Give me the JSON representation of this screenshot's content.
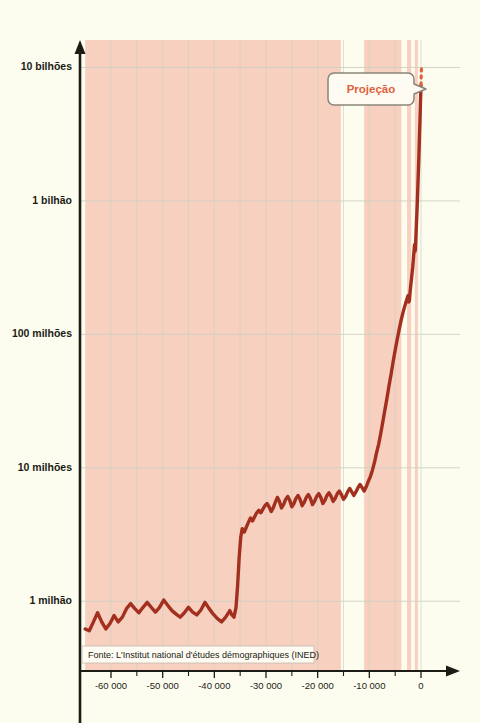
{
  "figure": {
    "background_color": "#fdfdef",
    "axis_color": "#1c1c16",
    "grid_color": "#cfcfc4",
    "curve_color": "#a32f1e",
    "band_color": "#f7d0c0",
    "annotation_color": "#d1553a",
    "projection_color": "#e2603c"
  },
  "source": {
    "label": "Fonte: L'Institut national d'études démographiques (INED)"
  },
  "callout": {
    "label": "Projeção"
  },
  "annotations": [
    {
      "name": "inovacoes",
      "lines": [
        "Inovações",
        "técnicas e",
        "sociais"
      ],
      "x": 224,
      "y": 607
    },
    {
      "name": "revolucao-neolitica",
      "lines": [
        "\"Revolução\"",
        "neolítica"
      ],
      "x": 380,
      "y": 487
    },
    {
      "name": "revolucao-industrial",
      "lines": [
        "Revolução",
        "industrial"
      ],
      "x": 424,
      "y": 396
    }
  ],
  "chart_data": {
    "type": "line",
    "title": "",
    "xlabel": "",
    "ylabel": "",
    "y_scale": "log",
    "ylim": [
      300000,
      14000000000
    ],
    "xlim": [
      -66000,
      6000
    ],
    "grid": true,
    "legend": "none",
    "y_ticks": [
      {
        "value": 1000000,
        "label": "1 milhão"
      },
      {
        "value": 10000000,
        "label": "10 milhões"
      },
      {
        "value": 100000000,
        "label": "100 milhões"
      },
      {
        "value": 1000000000,
        "label": "1 bilhão"
      },
      {
        "value": 10000000000,
        "label": "10 bilhões"
      }
    ],
    "x_ticks": [
      {
        "value": -60000,
        "label": "-60 000"
      },
      {
        "value": -50000,
        "label": "-50 000"
      },
      {
        "value": -40000,
        "label": "-40 000"
      },
      {
        "value": -30000,
        "label": "-30 000"
      },
      {
        "value": -20000,
        "label": "-20 000"
      },
      {
        "value": -10000,
        "label": "-10 000"
      },
      {
        "value": 0,
        "label": "0"
      }
    ],
    "shaded_bands": [
      {
        "name": "inovacoes-tecnicas-band",
        "x0": -65000,
        "x1": -15500
      },
      {
        "name": "neolitico-band",
        "x0": -11000,
        "x1": -3800
      },
      {
        "name": "revolucao-industrial-band",
        "x0": -2700,
        "x1": -1900
      },
      {
        "name": "era-moderna-band",
        "x0": -1200,
        "x1": -600
      }
    ],
    "series": [
      {
        "name": "População mundial",
        "points": [
          [
            -65000,
            620000
          ],
          [
            -64200,
            600000
          ],
          [
            -63400,
            700000
          ],
          [
            -62600,
            820000
          ],
          [
            -61800,
            700000
          ],
          [
            -61000,
            620000
          ],
          [
            -60200,
            680000
          ],
          [
            -59400,
            780000
          ],
          [
            -58600,
            700000
          ],
          [
            -57800,
            760000
          ],
          [
            -57000,
            880000
          ],
          [
            -56200,
            960000
          ],
          [
            -55400,
            880000
          ],
          [
            -54600,
            820000
          ],
          [
            -53800,
            900000
          ],
          [
            -53000,
            980000
          ],
          [
            -52200,
            900000
          ],
          [
            -51400,
            830000
          ],
          [
            -50600,
            900000
          ],
          [
            -49800,
            1020000
          ],
          [
            -49000,
            930000
          ],
          [
            -48200,
            850000
          ],
          [
            -47400,
            800000
          ],
          [
            -46600,
            760000
          ],
          [
            -45800,
            820000
          ],
          [
            -45000,
            900000
          ],
          [
            -44200,
            830000
          ],
          [
            -43400,
            790000
          ],
          [
            -42600,
            860000
          ],
          [
            -41800,
            980000
          ],
          [
            -41000,
            880000
          ],
          [
            -40200,
            800000
          ],
          [
            -39400,
            740000
          ],
          [
            -38600,
            700000
          ],
          [
            -37800,
            760000
          ],
          [
            -37000,
            850000
          ],
          [
            -36600,
            790000
          ],
          [
            -36200,
            760000
          ],
          [
            -35800,
            900000
          ],
          [
            -35500,
            1300000
          ],
          [
            -35200,
            2100000
          ],
          [
            -34900,
            3000000
          ],
          [
            -34600,
            3500000
          ],
          [
            -34200,
            3300000
          ],
          [
            -33800,
            3600000
          ],
          [
            -33400,
            3900000
          ],
          [
            -33000,
            4200000
          ],
          [
            -32600,
            4000000
          ],
          [
            -32200,
            4300000
          ],
          [
            -31800,
            4600000
          ],
          [
            -31400,
            4800000
          ],
          [
            -31000,
            4600000
          ],
          [
            -30600,
            4900000
          ],
          [
            -30200,
            5200000
          ],
          [
            -29800,
            5400000
          ],
          [
            -29400,
            5100000
          ],
          [
            -29000,
            4700000
          ],
          [
            -28600,
            5000000
          ],
          [
            -28200,
            5500000
          ],
          [
            -27800,
            6000000
          ],
          [
            -27400,
            5600000
          ],
          [
            -27000,
            5000000
          ],
          [
            -26600,
            5300000
          ],
          [
            -26200,
            5800000
          ],
          [
            -25800,
            6100000
          ],
          [
            -25400,
            5700000
          ],
          [
            -25000,
            5100000
          ],
          [
            -24600,
            5400000
          ],
          [
            -24200,
            5900000
          ],
          [
            -23800,
            6200000
          ],
          [
            -23400,
            5800000
          ],
          [
            -23000,
            5200000
          ],
          [
            -22600,
            5500000
          ],
          [
            -22200,
            6000000
          ],
          [
            -21800,
            6300000
          ],
          [
            -21400,
            5900000
          ],
          [
            -21000,
            5300000
          ],
          [
            -20600,
            5600000
          ],
          [
            -20200,
            6100000
          ],
          [
            -19800,
            6400000
          ],
          [
            -19400,
            6000000
          ],
          [
            -19000,
            5400000
          ],
          [
            -18600,
            5700000
          ],
          [
            -18200,
            6200000
          ],
          [
            -17800,
            6500000
          ],
          [
            -17400,
            6100000
          ],
          [
            -17000,
            5600000
          ],
          [
            -16600,
            5900000
          ],
          [
            -16200,
            6400000
          ],
          [
            -15800,
            6700000
          ],
          [
            -15400,
            6300000
          ],
          [
            -15000,
            5800000
          ],
          [
            -14600,
            6100000
          ],
          [
            -14200,
            6600000
          ],
          [
            -13800,
            7000000
          ],
          [
            -13400,
            6600000
          ],
          [
            -13000,
            6200000
          ],
          [
            -12600,
            6600000
          ],
          [
            -12200,
            7100000
          ],
          [
            -11800,
            7500000
          ],
          [
            -11400,
            7100000
          ],
          [
            -11000,
            6700000
          ],
          [
            -10600,
            7200000
          ],
          [
            -10200,
            7900000
          ],
          [
            -9800,
            8600000
          ],
          [
            -9400,
            9600000
          ],
          [
            -9000,
            11000000
          ],
          [
            -8600,
            13000000
          ],
          [
            -8200,
            15000000
          ],
          [
            -7800,
            18000000
          ],
          [
            -7400,
            22000000
          ],
          [
            -7000,
            27000000
          ],
          [
            -6600,
            33000000
          ],
          [
            -6200,
            41000000
          ],
          [
            -5800,
            50000000
          ],
          [
            -5400,
            62000000
          ],
          [
            -5000,
            76000000
          ],
          [
            -4600,
            92000000
          ],
          [
            -4200,
            110000000
          ],
          [
            -3800,
            130000000
          ],
          [
            -3400,
            150000000
          ],
          [
            -3000,
            170000000
          ],
          [
            -2700,
            185000000
          ],
          [
            -2500,
            195000000
          ],
          [
            -2350,
            175000000
          ],
          [
            -2250,
            180000000
          ],
          [
            -2150,
            200000000
          ],
          [
            -2000,
            230000000
          ],
          [
            -1800,
            270000000
          ],
          [
            -1600,
            320000000
          ],
          [
            -1400,
            400000000
          ],
          [
            -1250,
            470000000
          ],
          [
            -1150,
            420000000
          ],
          [
            -1080,
            440000000
          ],
          [
            -1000,
            520000000
          ],
          [
            -900,
            650000000
          ],
          [
            -800,
            800000000
          ],
          [
            -700,
            1000000000
          ],
          [
            -600,
            1300000000
          ],
          [
            -500,
            1700000000
          ],
          [
            -400,
            2200000000
          ],
          [
            -300,
            3000000000
          ],
          [
            -200,
            4000000000
          ],
          [
            -120,
            5300000000
          ],
          [
            -60,
            6200000000
          ],
          [
            -20,
            7000000000
          ],
          [
            0,
            7400000000
          ]
        ],
        "projection": {
          "name": "Projeção",
          "style": "dotted",
          "points": [
            [
              0,
              7400000000
            ],
            [
              60,
              9200000000
            ],
            [
              120,
              10500000000
            ]
          ]
        }
      }
    ]
  }
}
